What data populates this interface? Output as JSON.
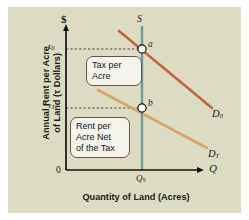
{
  "figure": {
    "background_color": "#dcdcc3",
    "axes": {
      "y_title_line1": "Annual Rent per Acre",
      "y_title_line2": "of Land (τ Dollars)",
      "x_title": "Quantity of Land (Acres)",
      "y_axis_symbol": "$",
      "x_axis_symbol": "Q",
      "origin_label": "0"
    },
    "ticks": {
      "y": [
        {
          "label_base": "τ",
          "label_sub": "0",
          "value_name": "tau-0"
        },
        {
          "label_base": "τ",
          "label_sub": "T",
          "value_name": "tau-T"
        }
      ],
      "x": [
        {
          "label_base": "Q",
          "label_sub": "S",
          "value_name": "Q-S"
        }
      ]
    },
    "curves": [
      {
        "name": "supply",
        "label": "S",
        "color": "#6f9aa0",
        "type": "vertical-supply"
      },
      {
        "name": "demand-before-tax",
        "label_base": "D",
        "label_sub": "0",
        "color": "#c1653f",
        "type": "downward-demand"
      },
      {
        "name": "demand-after-tax",
        "label_base": "D",
        "label_sub": "T",
        "color": "#dda46a",
        "type": "downward-demand"
      }
    ],
    "points": [
      {
        "name": "point-a",
        "label": "a",
        "on": "supply × demand-before-tax"
      },
      {
        "name": "point-b",
        "label": "b",
        "on": "supply × demand-after-tax"
      }
    ],
    "callouts": [
      {
        "name": "tax-per-acre-callout",
        "lines": [
          "Tax per",
          "Acre"
        ]
      },
      {
        "name": "rent-net-of-tax-callout",
        "lines": [
          "Rent per",
          "Acre Net",
          "of the Tax"
        ]
      }
    ]
  }
}
